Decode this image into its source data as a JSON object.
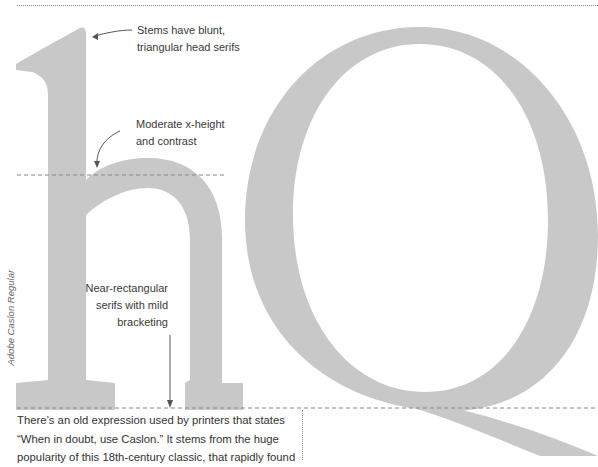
{
  "specimen": {
    "glyphs": "hQ",
    "typeface_label": "Adobe Caslon Regular",
    "glyph_color": "#c8c8c8",
    "guide_color": "#888888"
  },
  "annotations": [
    {
      "id": "head-serifs",
      "lines": [
        "Stems have blunt,",
        "triangular head serifs"
      ]
    },
    {
      "id": "x-height",
      "lines": [
        "Moderate x-height",
        "and contrast"
      ]
    },
    {
      "id": "foot-serifs",
      "lines": [
        "Near-rectangular",
        "serifs with mild",
        "bracketing"
      ]
    }
  ],
  "body": {
    "lines": [
      "There’s an old expression used by printers that states",
      "“When in doubt, use Caslon.” It stems from the huge",
      "popularity of this 18th-century classic, that rapidly found"
    ]
  }
}
